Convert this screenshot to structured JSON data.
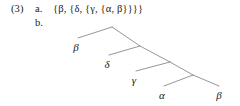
{
  "example": {
    "number": "(3)",
    "item_a_letter": "a.",
    "item_b_letter": "b.",
    "set_notation": "{β, {δ, {γ, {α, β}}}}"
  },
  "tree": {
    "line_color": "#8a8a8a",
    "text_color": "#1a1a1a",
    "background": "#ffffff",
    "nodes": [
      {
        "id": "n1",
        "x": 112,
        "y": 27,
        "type": "internal"
      },
      {
        "id": "n2",
        "x": 140,
        "y": 46,
        "type": "internal"
      },
      {
        "id": "n3",
        "x": 170,
        "y": 62,
        "type": "internal"
      },
      {
        "id": "n4",
        "x": 193,
        "y": 75,
        "type": "internal"
      }
    ],
    "leaves": [
      {
        "id": "l1",
        "label": "β",
        "x": 76,
        "y": 40,
        "text_x": 76,
        "text_y": 42
      },
      {
        "id": "l2",
        "label": "δ",
        "x": 107,
        "y": 57,
        "text_x": 107,
        "text_y": 59
      },
      {
        "id": "l3",
        "label": "γ",
        "x": 134,
        "y": 73,
        "text_x": 134,
        "text_y": 75
      },
      {
        "id": "l4",
        "label": "α",
        "x": 162,
        "y": 88,
        "text_x": 162,
        "text_y": 90
      },
      {
        "id": "l5",
        "label": "β",
        "x": 219,
        "y": 88,
        "text_x": 219,
        "text_y": 90
      }
    ],
    "branches": [
      {
        "from": "n1",
        "to": "l1",
        "x1": 112,
        "y1": 27,
        "x2": 78,
        "y2": 38
      },
      {
        "from": "n1",
        "to": "n2",
        "x1": 112,
        "y1": 27,
        "x2": 140,
        "y2": 46
      },
      {
        "from": "n2",
        "to": "l2",
        "x1": 140,
        "y1": 46,
        "x2": 109,
        "y2": 55
      },
      {
        "from": "n2",
        "to": "n3",
        "x1": 140,
        "y1": 46,
        "x2": 170,
        "y2": 62
      },
      {
        "from": "n3",
        "to": "l3",
        "x1": 170,
        "y1": 62,
        "x2": 136,
        "y2": 71
      },
      {
        "from": "n3",
        "to": "n4",
        "x1": 170,
        "y1": 62,
        "x2": 193,
        "y2": 75
      },
      {
        "from": "n4",
        "to": "l4",
        "x1": 193,
        "y1": 75,
        "x2": 164,
        "y2": 86
      },
      {
        "from": "n4",
        "to": "l5",
        "x1": 193,
        "y1": 75,
        "x2": 219,
        "y2": 86
      }
    ]
  }
}
